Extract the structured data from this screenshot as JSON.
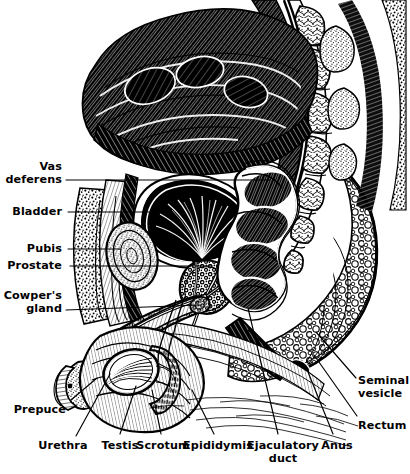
{
  "figure": {
    "style": "pen-and-ink engraving",
    "ink_color": "#000000",
    "paper_color": "#ffffff",
    "width": 410,
    "height": 474
  },
  "labels": [
    {
      "id": "vas-deferens",
      "text": "Vas\ndeferens",
      "align": "right",
      "x": 62,
      "y": 161,
      "leader": [
        [
          66,
          180
        ],
        [
          270,
          180
        ]
      ]
    },
    {
      "id": "bladder",
      "text": "Bladder",
      "align": "right",
      "x": 62,
      "y": 206,
      "leader": [
        [
          68,
          212
        ],
        [
          158,
          212
        ]
      ]
    },
    {
      "id": "pubis",
      "text": "Pubis",
      "align": "right",
      "x": 62,
      "y": 243,
      "leader": [
        [
          68,
          249
        ],
        [
          120,
          249
        ]
      ]
    },
    {
      "id": "prostate",
      "text": "Prostate",
      "align": "right",
      "x": 62,
      "y": 260,
      "leader": [
        [
          70,
          266
        ],
        [
          212,
          266
        ]
      ]
    },
    {
      "id": "cowpers-gland",
      "text": "Cowper's\ngland",
      "align": "right",
      "x": 62,
      "y": 290,
      "leader": [
        [
          66,
          310
        ],
        [
          200,
          305
        ]
      ]
    },
    {
      "id": "prepuce",
      "text": "Prepuce",
      "align": "right",
      "x": 66,
      "y": 404,
      "leader": [
        [
          71,
          400
        ],
        [
          97,
          378
        ]
      ]
    },
    {
      "id": "urethra",
      "text": "Urethra",
      "align": "center",
      "x": 63,
      "y": 440,
      "leader": [
        [
          76,
          436
        ],
        [
          110,
          374
        ]
      ]
    },
    {
      "id": "testis",
      "text": "Testis",
      "align": "center",
      "x": 120,
      "y": 440,
      "leader": [
        [
          120,
          434
        ],
        [
          136,
          386
        ]
      ]
    },
    {
      "id": "scrotum",
      "text": "Scrotum",
      "align": "center",
      "x": 163,
      "y": 440,
      "leader": [
        [
          161,
          434
        ],
        [
          152,
          390
        ]
      ]
    },
    {
      "id": "epididymis",
      "text": "Epididymis",
      "align": "center",
      "x": 218,
      "y": 440,
      "leader": [
        [
          214,
          434
        ],
        [
          192,
          390
        ]
      ]
    },
    {
      "id": "ejaculatory-duct",
      "text": "Ejaculatory\nduct",
      "align": "center",
      "x": 283,
      "y": 440,
      "leader": [
        [
          278,
          434
        ],
        [
          248,
          308
        ]
      ]
    },
    {
      "id": "anus",
      "text": "Anus",
      "align": "center",
      "x": 337,
      "y": 440,
      "leader": [
        [
          333,
          434
        ],
        [
          308,
          372
        ]
      ]
    },
    {
      "id": "rectum",
      "text": "Rectum",
      "align": "left",
      "x": 358,
      "y": 420,
      "leader": [
        [
          357,
          416
        ],
        [
          314,
          355
        ]
      ]
    },
    {
      "id": "seminal-vesicle",
      "text": "Seminal\nvesicle",
      "align": "left",
      "x": 358,
      "y": 375,
      "leader": [
        [
          356,
          378
        ],
        [
          316,
          332
        ]
      ]
    }
  ],
  "anatomy": {
    "regions": [
      "abdominal wall",
      "peritoneal cavity",
      "urinary bladder",
      "pubic symphysis",
      "prostate gland",
      "Cowper's (bulbourethral) gland",
      "penis and prepuce",
      "urethra",
      "testis",
      "scrotum",
      "epididymis",
      "ejaculatory duct",
      "seminal vesicle",
      "rectum",
      "anus",
      "sacrum and coccyx",
      "gluteal region"
    ]
  }
}
